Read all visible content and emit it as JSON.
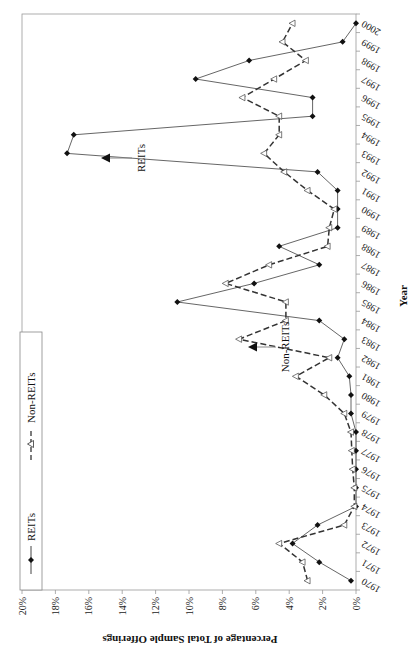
{
  "chart_data": {
    "type": "line",
    "title": "",
    "xlabel": "Year",
    "ylabel": "Percentage of Total Sample Offerings",
    "ylim": [
      0,
      20
    ],
    "yticks": [
      "0%",
      "2%",
      "4%",
      "6%",
      "8%",
      "10%",
      "12%",
      "14%",
      "16%",
      "18%",
      "20%"
    ],
    "grid": false,
    "legend_position": "upper left (boxed)",
    "orientation_note": "figure rotated 90 degrees counter-clockwise on page",
    "categories": [
      "1970",
      "1971",
      "1972",
      "1973",
      "1974",
      "1975",
      "1976",
      "1977",
      "1978",
      "1979",
      "1980",
      "1981",
      "1982",
      "1983",
      "1984",
      "1985",
      "1986",
      "1987",
      "1988",
      "1989",
      "1990",
      "1991",
      "1992",
      "1993",
      "1994",
      "1995",
      "1996",
      "1997",
      "1998",
      "1999",
      "2000"
    ],
    "series": [
      {
        "name": "REITs",
        "style": "solid line, filled diamond markers",
        "values": [
          0.3,
          2.2,
          3.8,
          2.3,
          0.0,
          0.0,
          0.0,
          0.0,
          0.0,
          0.3,
          0.3,
          0.4,
          1.1,
          0.7,
          2.2,
          10.7,
          6.1,
          2.2,
          4.6,
          1.1,
          1.1,
          1.1,
          2.3,
          17.3,
          16.9,
          2.6,
          2.6,
          9.6,
          6.4,
          0.8,
          0.0
        ]
      },
      {
        "name": "Non-REITs",
        "style": "dashed line, open triangle markers",
        "values": [
          2.9,
          3.2,
          4.6,
          0.7,
          0.1,
          0.1,
          0.2,
          0.25,
          0.3,
          0.7,
          1.9,
          3.6,
          1.6,
          7.0,
          4.2,
          4.2,
          7.8,
          5.2,
          1.7,
          1.6,
          1.3,
          2.9,
          4.3,
          5.5,
          4.6,
          4.6,
          6.8,
          4.9,
          3.0,
          4.4,
          3.8
        ]
      }
    ],
    "annotations": [
      {
        "text": "REITs",
        "points_to_year": "1993",
        "style": "arrow"
      },
      {
        "text": "Non-REITs",
        "points_to_year": "1983",
        "style": "arrow"
      }
    ]
  },
  "legend": {
    "items": [
      {
        "label": "REITs"
      },
      {
        "label": "Non-REITs"
      }
    ]
  }
}
